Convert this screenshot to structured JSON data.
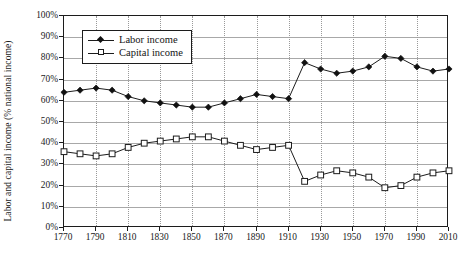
{
  "axes": {
    "ylabel": "Labor and capital income (% national income)",
    "yticks": [
      "0%",
      "10%",
      "20%",
      "30%",
      "40%",
      "50%",
      "60%",
      "70%",
      "80%",
      "90%",
      "100%"
    ],
    "xticks": [
      "1770",
      "1790",
      "1810",
      "1830",
      "1850",
      "1870",
      "1890",
      "1910",
      "1930",
      "1950",
      "1970",
      "1990",
      "2010"
    ]
  },
  "legend": {
    "items": [
      {
        "label": "Labor income",
        "marker": "filled-diamond-icon"
      },
      {
        "label": "Capital income",
        "marker": "open-square-icon"
      }
    ]
  },
  "chart_data": {
    "type": "line",
    "title": "",
    "xlabel": "",
    "ylabel": "Labor and capital income (% national income)",
    "xlim": [
      1770,
      2010
    ],
    "ylim": [
      0,
      100
    ],
    "yticks": [
      0,
      10,
      20,
      30,
      40,
      50,
      60,
      70,
      80,
      90,
      100
    ],
    "xticks": [
      1770,
      1790,
      1810,
      1830,
      1850,
      1870,
      1890,
      1910,
      1930,
      1950,
      1970,
      1990,
      2010
    ],
    "grid": "horizontal-solid-and-vertical-dotted",
    "legend_position": "upper-left-inside",
    "x": [
      1770,
      1780,
      1790,
      1800,
      1810,
      1820,
      1830,
      1840,
      1850,
      1860,
      1870,
      1880,
      1890,
      1900,
      1910,
      1920,
      1930,
      1940,
      1950,
      1960,
      1970,
      1980,
      1990,
      2000,
      2010
    ],
    "series": [
      {
        "name": "Labor income",
        "marker": "filled-diamond",
        "values": [
          64,
          65,
          66,
          65,
          62,
          60,
          59,
          58,
          57,
          57,
          59,
          61,
          63,
          62,
          61,
          78,
          75,
          73,
          74,
          76,
          81,
          80,
          76,
          74,
          75
        ]
      },
      {
        "name": "Capital income",
        "marker": "open-square",
        "values": [
          36,
          35,
          34,
          35,
          38,
          40,
          41,
          42,
          43,
          43,
          41,
          39,
          37,
          38,
          39,
          22,
          25,
          27,
          26,
          24,
          19,
          20,
          24,
          26,
          27
        ]
      }
    ]
  }
}
